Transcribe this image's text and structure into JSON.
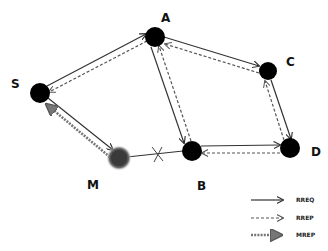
{
  "diagram": {
    "title": "",
    "nodes": [
      {
        "id": "S",
        "label": "S",
        "x": 40,
        "y": 93,
        "r": 10,
        "fill": "#000000",
        "malicious": false,
        "label_x": 11,
        "label_y": 88
      },
      {
        "id": "A",
        "label": "A",
        "x": 155,
        "y": 37,
        "r": 10,
        "fill": "#000000",
        "malicious": false,
        "label_x": 161,
        "label_y": 22
      },
      {
        "id": "C",
        "label": "C",
        "x": 268,
        "y": 71,
        "r": 9,
        "fill": "#000000",
        "malicious": false,
        "label_x": 286,
        "label_y": 66
      },
      {
        "id": "B",
        "label": "B",
        "x": 192,
        "y": 151,
        "r": 10,
        "fill": "#000000",
        "malicious": false,
        "label_x": 197,
        "label_y": 190
      },
      {
        "id": "D",
        "label": "D",
        "x": 290,
        "y": 148,
        "r": 10,
        "fill": "#000000",
        "malicious": false,
        "label_x": 311,
        "label_y": 156
      },
      {
        "id": "M",
        "label": "M",
        "x": 119,
        "y": 158,
        "r": 9,
        "fill": "#3a3a3a",
        "malicious": true,
        "label_x": 87,
        "label_y": 189
      }
    ],
    "edges": [
      {
        "from": "S",
        "to": "A",
        "messages": [
          "RREQ",
          "RREP"
        ]
      },
      {
        "from": "A",
        "to": "C",
        "messages": [
          "RREQ",
          "RREP"
        ]
      },
      {
        "from": "C",
        "to": "D",
        "messages": [
          "RREQ",
          "RREP"
        ]
      },
      {
        "from": "A",
        "to": "B",
        "messages": [
          "RREQ",
          "RREP"
        ]
      },
      {
        "from": "B",
        "to": "D",
        "messages": [
          "RREQ",
          "RREP"
        ]
      },
      {
        "from": "S",
        "to": "M",
        "messages": [
          "RREQ",
          "MREP"
        ]
      },
      {
        "from": "M",
        "to": "B",
        "messages": [
          "broken-link"
        ]
      }
    ],
    "link_break": {
      "x": 158,
      "y": 154,
      "symbol": "X"
    }
  },
  "legend": {
    "items": [
      {
        "label": "RREQ",
        "style": "solid"
      },
      {
        "label": "RREP",
        "style": "dashed"
      },
      {
        "label": "MREP",
        "style": "thick-dotted"
      }
    ]
  },
  "colors": {
    "node": "#000000",
    "malicious_node": "#3a3a3a",
    "malicious_glow": "#9a9a9a",
    "line": "#333333",
    "background": "#ffffff"
  }
}
